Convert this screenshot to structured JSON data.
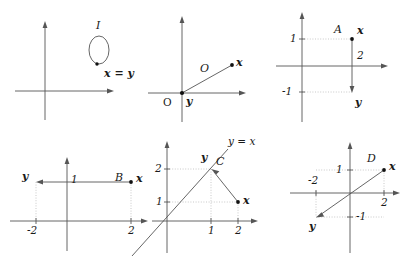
{
  "figure": {
    "kind": "math-figure",
    "stroke_color": "#555555",
    "dotted_color": "#bbbbbb",
    "text_color": "#1a1a1a",
    "background": "#ffffff"
  },
  "panels": [
    {
      "id": "I",
      "operator_label": "I",
      "vector_label": "x = y",
      "axes": {
        "x_arrow": true,
        "y_arrow": true
      },
      "marks": [
        {
          "name": "loop",
          "shape": "ellipse"
        }
      ],
      "ticks": []
    },
    {
      "id": "O",
      "operator_label": "O",
      "origin_label": "O",
      "source_label": "y",
      "target_label": "x",
      "axes": {
        "x_arrow": true,
        "y_arrow": true
      },
      "ticks": []
    },
    {
      "id": "A",
      "operator_label": "A",
      "source_label": "x",
      "target_label": "y",
      "segment_label": "2",
      "axes": {
        "x_arrow": true,
        "y_arrow": true
      },
      "ticks": [
        "1",
        "-1"
      ],
      "points": {
        "x": [
          2,
          1
        ],
        "y": [
          2,
          -1
        ]
      }
    },
    {
      "id": "B",
      "operator_label": "B",
      "source_label": "x",
      "target_label": "y",
      "axes": {
        "x_arrow": true,
        "y_arrow": true
      },
      "ticks": [
        "1",
        "-2",
        "2"
      ],
      "points": {
        "x": [
          2,
          1
        ],
        "y": [
          -2,
          1
        ]
      }
    },
    {
      "id": "C",
      "operator_label": "C",
      "source_label": "x",
      "target_label": "y",
      "line_label": "y = x",
      "axes": {
        "x_arrow": true,
        "y_arrow": true
      },
      "ticks": [
        "2",
        "1",
        "1",
        "2"
      ],
      "points": {
        "x": [
          2,
          1
        ],
        "y": [
          1,
          2
        ]
      }
    },
    {
      "id": "D",
      "operator_label": "D",
      "source_label": "x",
      "target_label": "y",
      "axes": {
        "x_arrow": true,
        "y_arrow": true
      },
      "ticks": [
        "1",
        "-2",
        "2",
        "-1"
      ],
      "points": {
        "x": [
          2,
          1
        ],
        "y": [
          -2,
          -1
        ]
      }
    }
  ],
  "text": {
    "p1_I": "I",
    "p1_xy": "x = y",
    "p2_O_origin": "O",
    "p2_O_op": "O",
    "p2_y": "y",
    "p2_x": "x",
    "p3_A": "A",
    "p3_x": "x",
    "p3_y": "y",
    "p3_two": "2",
    "p3_one": "1",
    "p3_negone": "-1",
    "p4_B": "B",
    "p4_x": "x",
    "p4_y": "y",
    "p4_one": "1",
    "p4_negtwo": "-2",
    "p4_two": "2",
    "p5_C": "C",
    "p5_x": "x",
    "p5_y": "y",
    "p5_line": "y = x",
    "p5_two_v": "2",
    "p5_one_v": "1",
    "p5_one_h": "1",
    "p5_two_h": "2",
    "p6_D": "D",
    "p6_x": "x",
    "p6_y": "y",
    "p6_one": "1",
    "p6_negtwo": "-2",
    "p6_two": "2",
    "p6_negone": "-1"
  }
}
